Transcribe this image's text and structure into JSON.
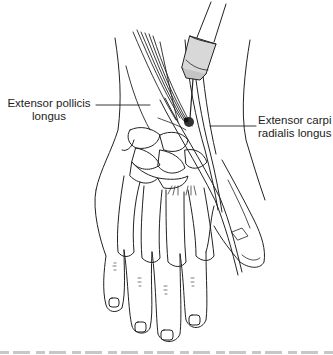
{
  "figure": {
    "labels": {
      "left": {
        "line1": "Extensor pollicis",
        "line2": "longus"
      },
      "right": {
        "line1": "Extensor carpi",
        "line2": "radialis longus"
      }
    },
    "caption_visible": "partially cut off at bottom edge"
  },
  "colors": {
    "line": "#222222",
    "background": "#ffffff",
    "syringe_fill": "#d8d8d8",
    "injection_spot": "#333333"
  }
}
